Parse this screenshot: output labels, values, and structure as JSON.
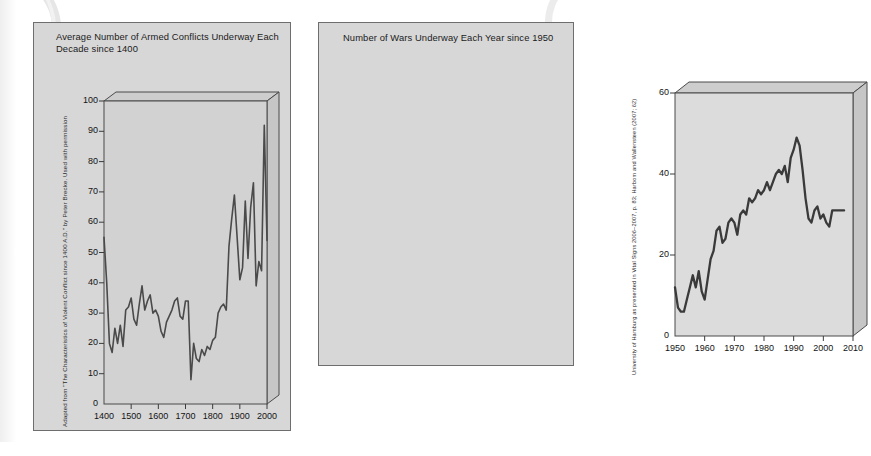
{
  "page": {
    "caption": "FIGURE 10.1"
  },
  "left_chart": {
    "title": "Average Number of Armed Conflicts Underway Each Decade since 1400",
    "attribution": "Adapted from \"The Characteristics of Violent Conflict since 1400 A.D.\" by Peter Brecke. Used with permission",
    "y_ticks": [
      "0",
      "10",
      "20",
      "30",
      "40",
      "50",
      "60",
      "70",
      "80",
      "90",
      "100"
    ],
    "x_ticks": [
      "1400",
      "1500",
      "1600",
      "1700",
      "1800",
      "1900",
      "2000"
    ]
  },
  "right_chart": {
    "title": "Number of Wars Underway Each Year since 1950",
    "attribution": "University of Hamburg as presented in Vital Signs 2006–2007, p. 83; Harbom and Wallensteen (2007; 62)",
    "y_ticks": [
      "0",
      "20",
      "40",
      "60"
    ],
    "x_ticks": [
      "1950",
      "1960",
      "1970",
      "1980",
      "1990",
      "2000",
      "2010"
    ]
  },
  "chart_data": [
    {
      "type": "line",
      "id": "armed-conflicts-per-decade",
      "title": "Average Number of Armed Conflicts Underway Each Decade since 1400",
      "xlabel": "",
      "ylabel": "",
      "xlim": [
        1400,
        2000
      ],
      "ylim": [
        0,
        100
      ],
      "xticks": [
        1400,
        1500,
        1600,
        1700,
        1800,
        1900,
        2000
      ],
      "yticks": [
        0,
        10,
        20,
        30,
        40,
        50,
        60,
        70,
        80,
        90,
        100
      ],
      "grid": false,
      "legend": "none",
      "annotation": "Adapted from \"The Characteristics of Violent Conflict since 1400 A.D.\" by Peter Brecke. Used with permission",
      "x": [
        1400,
        1410,
        1420,
        1430,
        1440,
        1450,
        1460,
        1470,
        1480,
        1490,
        1500,
        1510,
        1520,
        1530,
        1540,
        1550,
        1560,
        1570,
        1580,
        1590,
        1600,
        1610,
        1620,
        1630,
        1640,
        1650,
        1660,
        1670,
        1680,
        1690,
        1700,
        1710,
        1720,
        1730,
        1740,
        1750,
        1760,
        1770,
        1780,
        1790,
        1800,
        1810,
        1820,
        1830,
        1840,
        1850,
        1860,
        1870,
        1880,
        1890,
        1900,
        1910,
        1920,
        1930,
        1940,
        1950,
        1960,
        1970,
        1980,
        1990,
        2000
      ],
      "y": [
        55,
        40,
        20,
        17,
        25,
        20,
        26,
        19,
        31,
        32,
        35,
        28,
        26,
        33,
        39,
        31,
        34,
        36,
        30,
        31,
        29,
        24,
        22,
        27,
        29,
        31,
        34,
        35,
        29,
        28,
        34,
        34,
        8,
        20,
        15,
        14,
        18,
        16,
        19,
        18,
        21,
        22,
        30,
        32,
        33,
        31,
        52,
        61,
        69,
        55,
        41,
        45,
        67,
        48,
        65,
        73,
        39,
        47,
        44,
        92,
        54
      ]
    },
    {
      "type": "line",
      "id": "wars-per-year",
      "title": "Number of Wars Underway Each Year since 1950",
      "xlabel": "",
      "ylabel": "",
      "xlim": [
        1950,
        2010
      ],
      "ylim": [
        0,
        60
      ],
      "xticks": [
        1950,
        1960,
        1970,
        1980,
        1990,
        2000,
        2010
      ],
      "yticks": [
        0,
        20,
        40,
        60
      ],
      "grid": false,
      "legend": "none",
      "annotation": "University of Hamburg as presented in Vital Signs 2006–2007, p. 83; Harbom and Wallensteen (2007; 62)",
      "x": [
        1950,
        1951,
        1952,
        1953,
        1954,
        1955,
        1956,
        1957,
        1958,
        1959,
        1960,
        1961,
        1962,
        1963,
        1964,
        1965,
        1966,
        1967,
        1968,
        1969,
        1970,
        1971,
        1972,
        1973,
        1974,
        1975,
        1976,
        1977,
        1978,
        1979,
        1980,
        1981,
        1982,
        1983,
        1984,
        1985,
        1986,
        1987,
        1988,
        1989,
        1990,
        1991,
        1992,
        1993,
        1994,
        1995,
        1996,
        1997,
        1998,
        1999,
        2000,
        2001,
        2002,
        2003,
        2004,
        2005,
        2006,
        2007
      ],
      "y": [
        12,
        7,
        6,
        6,
        9,
        12,
        15,
        12,
        16,
        11,
        9,
        14,
        19,
        21,
        26,
        27,
        23,
        24,
        28,
        29,
        28,
        25,
        30,
        31,
        30,
        34,
        33,
        34,
        36,
        35,
        36,
        38,
        36,
        38,
        40,
        41,
        40,
        42,
        38,
        44,
        46,
        49,
        47,
        41,
        34,
        29,
        28,
        31,
        32,
        29,
        30,
        28,
        27,
        31,
        31,
        31,
        31,
        31
      ]
    }
  ]
}
